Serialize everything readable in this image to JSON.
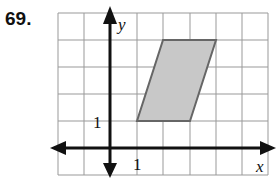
{
  "problem_number": "69.",
  "graph": {
    "x_label": "x",
    "y_label": "y",
    "x_tick_label": "1",
    "y_tick_label": "1",
    "grid": {
      "x_min": -2,
      "x_max": 6,
      "y_min": -1,
      "y_max": 5
    },
    "polygon": {
      "shape": "parallelogram",
      "vertices": [
        [
          1,
          1
        ],
        [
          4,
          1
        ],
        [
          5,
          4
        ],
        [
          2,
          4
        ]
      ],
      "fill": "#c8c8c8",
      "stroke": "#666666"
    }
  }
}
